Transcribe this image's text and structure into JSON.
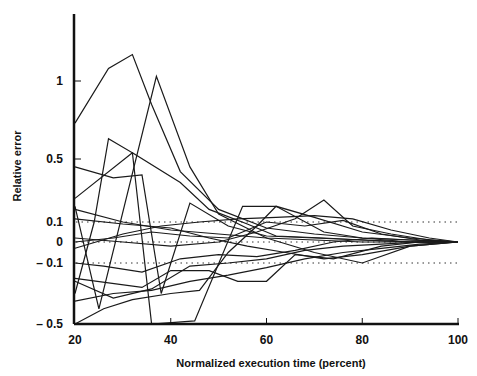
{
  "chart_data": {
    "type": "line",
    "title": "",
    "xlabel": "Normalized execution time (percent)",
    "ylabel": "Relative error",
    "xlim": [
      20,
      100
    ],
    "ylim": [
      -0.5,
      1.3
    ],
    "x_ticks": [
      20,
      40,
      60,
      80,
      100
    ],
    "x_tick_labels": [
      "20",
      "40",
      "60",
      "80",
      "100"
    ],
    "y_ticks": [
      -0.5,
      -0.1,
      0,
      0.1,
      0.5,
      1
    ],
    "y_tick_labels": [
      "– 0.5",
      "– 0.1",
      "0",
      "0.1",
      "0.5",
      "1"
    ],
    "reference_lines": [
      {
        "y": 0.1,
        "style": "dotted"
      },
      {
        "y": 0,
        "style": "dotted"
      },
      {
        "y": -0.1,
        "style": "dotted"
      }
    ],
    "grid": false,
    "legend": null,
    "series": [
      {
        "name": "s1",
        "x": [
          20,
          27,
          32,
          36,
          42,
          50,
          60,
          70,
          80,
          90,
          100
        ],
        "y": [
          0.73,
          1.08,
          1.17,
          0.85,
          0.42,
          0.18,
          0.07,
          0.04,
          0.02,
          0.01,
          0.0
        ]
      },
      {
        "name": "s2",
        "x": [
          20,
          25,
          37,
          44,
          50,
          60,
          70,
          80,
          90,
          100
        ],
        "y": [
          0.2,
          -0.4,
          1.03,
          0.45,
          0.15,
          0.02,
          0.01,
          0.0,
          0.0,
          0.0
        ]
      },
      {
        "name": "s3",
        "x": [
          20,
          28,
          34,
          38,
          44,
          52,
          60,
          70,
          80,
          90,
          100
        ],
        "y": [
          0.45,
          0.38,
          0.4,
          -0.3,
          0.22,
          0.08,
          0.03,
          0.02,
          0.01,
          0.0,
          0.0
        ]
      },
      {
        "name": "s4",
        "x": [
          20,
          24,
          27,
          32,
          36,
          45,
          55,
          62,
          72,
          80,
          90,
          100
        ],
        "y": [
          -0.3,
          0.1,
          0.63,
          0.54,
          -0.5,
          -0.48,
          0.2,
          0.2,
          0.05,
          0.02,
          0.0,
          0.0
        ]
      },
      {
        "name": "s5",
        "x": [
          20,
          32,
          42,
          48,
          56,
          62,
          72,
          80,
          90,
          100
        ],
        "y": [
          0.25,
          0.54,
          0.35,
          0.18,
          0.09,
          0.03,
          0.02,
          0.01,
          0.0,
          0.0
        ]
      },
      {
        "name": "s6",
        "x": [
          20,
          30,
          40,
          48,
          56,
          64,
          72,
          80,
          90,
          100
        ],
        "y": [
          0.12,
          0.09,
          0.07,
          0.02,
          -0.02,
          -0.05,
          -0.08,
          -0.06,
          -0.02,
          0.0
        ]
      },
      {
        "name": "s7",
        "x": [
          20,
          28,
          36,
          44,
          52,
          60,
          68,
          76,
          84,
          92,
          100
        ],
        "y": [
          0.0,
          0.02,
          0.05,
          0.03,
          0.02,
          0.1,
          0.08,
          0.11,
          0.04,
          0.01,
          0.0
        ]
      },
      {
        "name": "s8",
        "x": [
          20,
          30,
          38,
          46,
          54,
          62,
          70,
          78,
          86,
          94,
          100
        ],
        "y": [
          -0.03,
          0.04,
          0.08,
          0.1,
          0.12,
          0.13,
          0.14,
          0.12,
          0.06,
          0.02,
          0.0
        ]
      },
      {
        "name": "s9",
        "x": [
          20,
          26,
          34,
          42,
          50,
          58,
          66,
          74,
          82,
          90,
          100
        ],
        "y": [
          -0.1,
          -0.12,
          -0.16,
          -0.08,
          -0.06,
          -0.07,
          -0.04,
          0.0,
          0.02,
          0.01,
          0.0
        ]
      },
      {
        "name": "s10",
        "x": [
          20,
          28,
          36,
          44,
          52,
          60,
          68,
          76,
          84,
          92,
          100
        ],
        "y": [
          -0.22,
          -0.33,
          -0.27,
          -0.12,
          -0.1,
          -0.08,
          -0.04,
          -0.02,
          -0.01,
          0.0,
          0.0
        ]
      },
      {
        "name": "s11",
        "x": [
          20,
          28,
          36,
          44,
          52,
          60,
          68,
          76,
          84,
          92,
          100
        ],
        "y": [
          -0.35,
          -0.3,
          -0.28,
          -0.22,
          -0.18,
          -0.13,
          -0.08,
          -0.05,
          -0.03,
          -0.01,
          0.0
        ]
      },
      {
        "name": "s12",
        "x": [
          20,
          26,
          32,
          40,
          46,
          52,
          58,
          62,
          70,
          80,
          90,
          100
        ],
        "y": [
          -0.5,
          -0.4,
          -0.34,
          -0.3,
          -0.28,
          -0.05,
          0.08,
          0.2,
          0.13,
          0.05,
          0.02,
          0.0
        ]
      },
      {
        "name": "s13",
        "x": [
          20,
          30,
          40,
          50,
          58,
          66,
          72,
          78,
          86,
          94,
          100
        ],
        "y": [
          0.02,
          0.0,
          -0.02,
          0.0,
          0.05,
          0.12,
          0.24,
          0.08,
          0.04,
          0.01,
          0.0
        ]
      },
      {
        "name": "s14",
        "x": [
          20,
          30,
          40,
          50,
          60,
          70,
          80,
          90,
          100
        ],
        "y": [
          0.18,
          0.1,
          0.06,
          0.04,
          0.02,
          -0.05,
          -0.1,
          -0.02,
          0.0
        ]
      },
      {
        "name": "s15",
        "x": [
          20,
          34,
          40,
          48,
          54,
          60,
          66,
          74,
          84,
          92,
          100
        ],
        "y": [
          -0.2,
          -0.26,
          -0.15,
          -0.15,
          -0.22,
          -0.22,
          -0.06,
          -0.08,
          -0.02,
          0.0,
          0.0
        ]
      }
    ]
  }
}
